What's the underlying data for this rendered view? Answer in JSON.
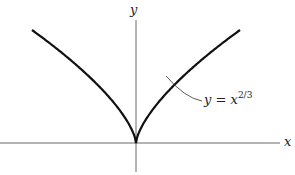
{
  "axes": {
    "x_label": "x",
    "y_label": "y"
  },
  "curve": {
    "label_lhs": "y",
    "label_eq": "=",
    "label_base": "x",
    "label_exp": "2/3",
    "color": "#111111"
  },
  "chart_data": {
    "type": "line",
    "title": "",
    "series": [
      {
        "name": "y = x^(2/3)",
        "function": "x^(2/3)"
      }
    ],
    "xlabel": "x",
    "ylabel": "y",
    "grid": false
  }
}
